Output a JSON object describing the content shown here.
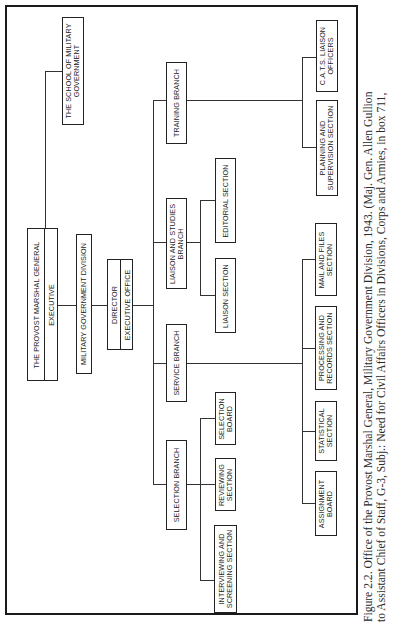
{
  "figure": {
    "orientation": "rotated-90-ccw",
    "colors": {
      "line": "#222222",
      "background": "#ffffff",
      "text": "#222222"
    }
  },
  "org_chart": {
    "school": "THE SCHOOL OF MILITARY\nGOVERNMENT",
    "provost": {
      "title": "THE PROVOST MARSHAL GENERAL",
      "sub": "EXECUTIVE"
    },
    "division": "MILITARY GOVERNMENT DIVISION",
    "director": {
      "title": "DIRECTOR",
      "sub": "EXECUTIVE OFFICE"
    },
    "branches": {
      "training": {
        "label": "TRAINING BRANCH",
        "sections": [
          "C.A.T.S. LIAISON\nOFFICERS",
          "PLANNING AND\nSUPERVISION SECTION"
        ]
      },
      "liaison_studies": {
        "label": "LIAISON AND STUDIES\nBRANCH",
        "sections": [
          "EDITORIAL SECTION",
          "LIAISON SECTION"
        ]
      },
      "service": {
        "label": "SERVICE BRANCH",
        "sections": [
          "MAIL AND FILES\nSECTION",
          "PROCESSING AND\nRECORDS SECTION",
          "STATISTICAL\nSECTION",
          "ASSIGNMENT\nBOARD"
        ]
      },
      "selection": {
        "label": "SELECTION BRANCH",
        "sections": [
          "SELECTION\nBOARD",
          "REVIEWING\nSECTION",
          "INTERVIEWING AND\nSCREENING SECTION"
        ]
      }
    }
  },
  "caption": {
    "lines": [
      "Figure 2.2. Office of the Provost Marshal General, Military Government Division, 1943. (Maj. Gen. Allen Gullion",
      "to Assistant Chief of Staff, G-3, Subj.: Need for Civil Affairs Officers in Divisions, Corps and Armies, in box 711,"
    ]
  }
}
